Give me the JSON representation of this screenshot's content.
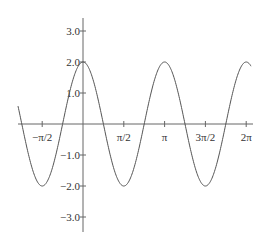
{
  "chart_data": {
    "type": "line",
    "title": "",
    "xlabel": "",
    "ylabel": "",
    "function": "y = 2cos(2x)",
    "xlim": [
      -1.98,
      6.45
    ],
    "ylim": [
      -3.4,
      3.4
    ],
    "x_ticks": [
      {
        "value": -1.5708,
        "label": "−π/2"
      },
      {
        "value": 1.5708,
        "label": "π/2"
      },
      {
        "value": 3.1416,
        "label": "π"
      },
      {
        "value": 4.7124,
        "label": "3π/2"
      },
      {
        "value": 6.2832,
        "label": "2π"
      }
    ],
    "y_ticks": [
      {
        "value": 3,
        "label": "3.0"
      },
      {
        "value": 2,
        "label": "2.0"
      },
      {
        "value": 1,
        "label": "1.0"
      },
      {
        "value": -1,
        "label": "−1.0"
      },
      {
        "value": -2,
        "label": "−2.0"
      },
      {
        "value": -3,
        "label": "−3.0"
      }
    ],
    "series": [
      {
        "name": "2cos(2x)",
        "amplitude": 2,
        "frequency": 2,
        "color": "#555555"
      }
    ],
    "grid": false,
    "legend": "none"
  }
}
